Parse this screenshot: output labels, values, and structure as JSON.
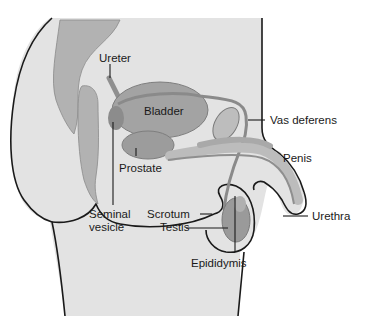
{
  "diagram": {
    "colors": {
      "body_fill": "#e3e3e3",
      "organ_dark": "#9a9a9a",
      "organ_mid": "#b4b4b4",
      "outline": "#1a1a1a",
      "text": "#1a1a1a"
    },
    "labels": {
      "ureter": "Ureter",
      "bladder": "Bladder",
      "vas_deferens": "Vas deferens",
      "penis": "Penis",
      "prostate": "Prostate",
      "seminal_vesicle_line1": "Seminal",
      "seminal_vesicle_line2": "vesicle",
      "scrotum": "Scrotum",
      "testis": "Testis",
      "urethra": "Urethra",
      "epididymis": "Epididymis"
    }
  }
}
